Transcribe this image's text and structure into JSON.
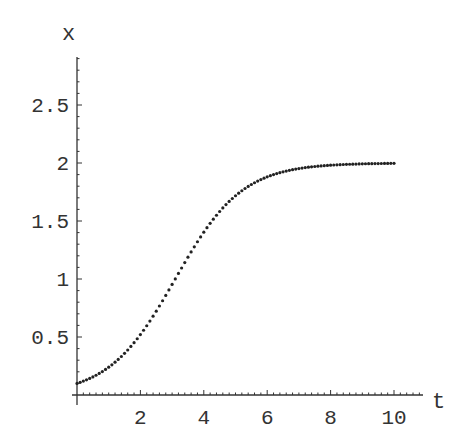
{
  "chart_data": {
    "type": "scatter",
    "title": "",
    "xlabel": "t",
    "ylabel": "x",
    "xlim": [
      0,
      10.9
    ],
    "ylim": [
      0,
      2.9
    ],
    "grid": false,
    "legend": null,
    "x_ticks": [
      2,
      4,
      6,
      8,
      10
    ],
    "x_tick_labels": [
      "2",
      "4",
      "6",
      "8",
      "10"
    ],
    "y_ticks": [
      0.5,
      1,
      1.5,
      2,
      2.5
    ],
    "y_tick_labels": [
      "0.5",
      "1",
      "1.5",
      "2",
      "2.5"
    ],
    "model": "logistic x(t) = 2/(1+19·e^(-0.95t)), sampled at t = 0,0.1,...,10",
    "series": [
      {
        "name": "x(t)",
        "marker": "dot",
        "color": "#222222",
        "t_start": 0,
        "t_step": 0.1,
        "t_end": 10,
        "x0": 0.1,
        "carrying_capacity": 2,
        "rate": 0.95
      }
    ]
  },
  "axes": {
    "x_label": "t",
    "y_label": "x"
  }
}
